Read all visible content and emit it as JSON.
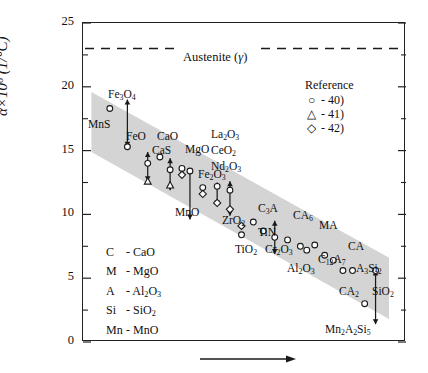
{
  "chart_data": {
    "type": "scatter",
    "title": "",
    "xlabel": "",
    "ylabel_html": "&alpha;&times;10<sup>6</sup> (1/&deg;C)",
    "ylabel": "a x 10^6 (1/°C)",
    "ylim": [
      0,
      25
    ],
    "yticks": [
      0,
      5,
      10,
      15,
      20,
      25
    ],
    "ytick_labels": [
      "0",
      "5",
      "10",
      "15",
      "20",
      "25"
    ],
    "yminor_step": 2.5,
    "grid": false,
    "x_axis_visible_ticks": false,
    "x_arrow_annotation": "arrow pointing right beneath x-axis",
    "reference_line": {
      "label_html": "Austenite (<i>&gamma;</i>)",
      "label": "Austenite (γ)",
      "value": 23,
      "style": "dashed"
    },
    "band": {
      "description": "grey diagonal band enclosing data trend",
      "color": "#d4d4d4",
      "left_top": 19.6,
      "left_bottom": 14.9,
      "right_top": 6.6,
      "right_bottom": 1.8
    },
    "legend": {
      "title": "Reference",
      "position": "upper-right",
      "entries": [
        {
          "marker": "circle",
          "label": "- 40)"
        },
        {
          "marker": "triangle",
          "label": "- 41)"
        },
        {
          "marker": "diamond",
          "label": "- 42)"
        }
      ]
    },
    "abbreviation_key": [
      {
        "abbr": "C",
        "meaning_html": "CaO",
        "meaning": "CaO"
      },
      {
        "abbr": "M",
        "meaning_html": "MgO",
        "meaning": "MgO"
      },
      {
        "abbr": "A",
        "meaning_html": "Al<sub>2</sub>O<sub>3</sub>",
        "meaning": "Al2O3"
      },
      {
        "abbr": "Si",
        "meaning_html": "SiO<sub>2</sub>",
        "meaning": "SiO2"
      },
      {
        "abbr": "Mn",
        "meaning_html": "MnO",
        "meaning": "MnO"
      }
    ],
    "point_labels": [
      {
        "text_html": "Fe<sub>3</sub>O<sub>4</sub>",
        "text": "Fe3O4",
        "x": 108,
        "y": 88
      },
      {
        "text_html": "MnS",
        "text": "MnS",
        "x": 88,
        "y": 118
      },
      {
        "text_html": "FeO",
        "text": "FeO",
        "x": 126,
        "y": 130
      },
      {
        "text_html": "CaS",
        "text": "CaS",
        "x": 152,
        "y": 144
      },
      {
        "text_html": "CaO",
        "text": "CaO",
        "x": 157,
        "y": 130
      },
      {
        "text_html": "MgO",
        "text": "MgO",
        "x": 185,
        "y": 143
      },
      {
        "text_html": "Fe<sub>2</sub>O<sub>3</sub>",
        "text": "Fe2O3",
        "x": 198,
        "y": 168
      },
      {
        "text_html": "MnO",
        "text": "MnO",
        "x": 175,
        "y": 206
      },
      {
        "text_html": "La<sub>2</sub>O<sub>3</sub>",
        "text": "La2O3",
        "x": 211,
        "y": 128
      },
      {
        "text_html": "CeO<sub>2</sub>",
        "text": "CeO2",
        "x": 211,
        "y": 144
      },
      {
        "text_html": "Nd<sub>2</sub>O<sub>3</sub>",
        "text": "Nd2O3",
        "x": 211,
        "y": 160
      },
      {
        "text_html": "ZrO<sub>2</sub>",
        "text": "ZrO2",
        "x": 222,
        "y": 214
      },
      {
        "text_html": "TiO<sub>2</sub>",
        "text": "TiO2",
        "x": 235,
        "y": 243
      },
      {
        "text_html": "TiN",
        "text": "TiN",
        "x": 258,
        "y": 226
      },
      {
        "text_html": "Cr<sub>2</sub>O<sub>3</sub>",
        "text": "Cr2O3",
        "x": 265,
        "y": 243
      },
      {
        "text_html": "C<sub>3</sub>A",
        "text": "C3A",
        "x": 258,
        "y": 202
      },
      {
        "text_html": "CA<sub>6</sub>",
        "text": "CA6",
        "x": 293,
        "y": 209
      },
      {
        "text_html": "Al<sub>2</sub>O<sub>3</sub>",
        "text": "Al2O3",
        "x": 287,
        "y": 262
      },
      {
        "text_html": "MA",
        "text": "MA",
        "x": 319,
        "y": 219
      },
      {
        "text_html": "C<sub>12</sub>A<sub>7</sub>",
        "text": "C12A7",
        "x": 318,
        "y": 253
      },
      {
        "text_html": "CA",
        "text": "CA",
        "x": 348,
        "y": 240
      },
      {
        "text_html": "A<sub>3</sub>Si<sub>2</sub>",
        "text": "A3Si2",
        "x": 356,
        "y": 262
      },
      {
        "text_html": "CA<sub>2</sub>",
        "text": "CA2",
        "x": 339,
        "y": 285
      },
      {
        "text_html": "SiO<sub>2</sub>",
        "text": "SiO2",
        "x": 372,
        "y": 285
      },
      {
        "text_html": "Mn<sub>2</sub>A<sub>2</sub>Si<sub>5</sub>",
        "text": "Mn2A2Si5",
        "x": 325,
        "y": 323
      }
    ],
    "markers": [
      {
        "shape": "circle",
        "x": 0.055,
        "value": 18.3
      },
      {
        "shape": "circle",
        "x": 0.165,
        "value": 15.3
      },
      {
        "shape": "arrowline",
        "x": 0.165,
        "value_top": 19.0,
        "value_bottom": 15.3
      },
      {
        "shape": "circle",
        "x": 0.292,
        "value": 14.0
      },
      {
        "shape": "triangle",
        "x": 0.292,
        "value": 12.6
      },
      {
        "shape": "arrowline",
        "x": 0.292,
        "value_top": 14.9,
        "value_bottom": 12.6
      },
      {
        "shape": "circle",
        "x": 0.368,
        "value": 14.5
      },
      {
        "shape": "circle",
        "x": 0.432,
        "value": 13.5
      },
      {
        "shape": "triangle",
        "x": 0.432,
        "value": 12.3
      },
      {
        "shape": "arrowline",
        "x": 0.432,
        "value_top": 14.4,
        "value_bottom": 11.9
      },
      {
        "shape": "circle",
        "x": 0.506,
        "value": 13.6
      },
      {
        "shape": "diamond",
        "x": 0.506,
        "value": 13.1
      },
      {
        "shape": "circle",
        "x": 0.556,
        "value": 13.4
      },
      {
        "shape": "arrowline",
        "x": 0.556,
        "value_top": 13.6,
        "value_bottom": 9.6
      },
      {
        "shape": "circle",
        "x": 0.636,
        "value": 12.1
      },
      {
        "shape": "diamond",
        "x": 0.636,
        "value": 11.6
      },
      {
        "shape": "circle",
        "x": 0.726,
        "value": 12.2
      },
      {
        "shape": "diamond",
        "x": 0.726,
        "value": 10.9
      },
      {
        "shape": "arrowline",
        "x": 0.726,
        "value_top": 12.5,
        "value_bottom": 10.7
      },
      {
        "shape": "circle",
        "x": 0.806,
        "value": 11.9
      },
      {
        "shape": "diamond",
        "x": 0.806,
        "value": 10.4
      },
      {
        "shape": "arrowline",
        "x": 0.806,
        "value_top": 12.6,
        "value_bottom": 9.9
      },
      {
        "shape": "diamond",
        "x": 0.878,
        "value": 9.1
      },
      {
        "shape": "circle",
        "x": 0.878,
        "value": 8.4
      },
      {
        "shape": "circle",
        "x": 0.952,
        "value": 9.4
      },
      {
        "shape": "circle",
        "x": 1.014,
        "value": 8.7
      },
      {
        "shape": "circle",
        "x": 1.086,
        "value": 8.2
      },
      {
        "shape": "arrowline",
        "x": 1.086,
        "value_top": 9.5,
        "value_bottom": 6.9
      },
      {
        "shape": "circle",
        "x": 1.166,
        "value": 8.0
      },
      {
        "shape": "circle",
        "x": 1.246,
        "value": 7.5
      },
      {
        "shape": "circle",
        "x": 1.286,
        "value": 7.2
      },
      {
        "shape": "circle",
        "x": 1.336,
        "value": 7.6
      },
      {
        "shape": "circle",
        "x": 1.398,
        "value": 6.8
      },
      {
        "shape": "circle",
        "x": 1.452,
        "value": 6.4
      },
      {
        "shape": "circle",
        "x": 1.512,
        "value": 5.6
      },
      {
        "shape": "circle",
        "x": 1.572,
        "value": 5.6
      },
      {
        "shape": "circle",
        "x": 1.648,
        "value": 3.0
      },
      {
        "shape": "circle",
        "x": 1.716,
        "value": 5.6
      },
      {
        "shape": "arrowline",
        "x": 1.716,
        "value_top": 5.6,
        "value_bottom": 1.4
      }
    ]
  }
}
